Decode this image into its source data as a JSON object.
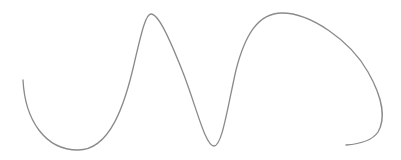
{
  "canvas": {
    "width": 401,
    "height": 160,
    "background": "#ffffff"
  },
  "stroke": {
    "color": "#8a8a8a",
    "width": 1.3
  },
  "path": {
    "d": "M 23 80 C 25 120, 45 150, 78 150 C 110 150, 125 105, 135 60 C 142 30, 146 14, 151 14 C 158 14, 168 35, 182 70 C 196 105, 205 146, 214 146 C 222 146, 227 110, 236 70 C 245 35, 258 13, 282 13 C 310 13, 350 40, 368 72 C 384 100, 385 120, 378 132 C 372 141, 360 144, 346 145"
  }
}
